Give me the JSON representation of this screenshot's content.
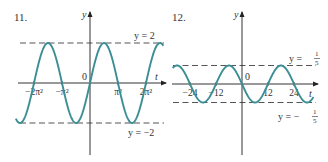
{
  "chart_data": [
    {
      "type": "line",
      "problem_number": "11.",
      "function_description": "sinusoid with amplitude 2 and period 2π²",
      "xlabel": "t",
      "ylabel": "y",
      "origin_label": "0",
      "x_ticks": [
        {
          "value_pi2": -2,
          "label": "−2π²"
        },
        {
          "value_pi2": -1,
          "label": "−π²"
        },
        {
          "value_pi2": 1,
          "label": "π²"
        },
        {
          "value_pi2": 2,
          "label": "2π²"
        }
      ],
      "x_unit": "π²",
      "xlim_pi2": [
        -2.65,
        2.62
      ],
      "amplitude": 2,
      "period_pi2": 2,
      "phase": "increasing through origin",
      "reference_lines": [
        {
          "y": 2,
          "label": "y = 2"
        },
        {
          "y": -2,
          "label": "y = −2"
        }
      ],
      "ylim": [
        -2.5,
        3.6
      ],
      "series": [
        {
          "name": "y = 2 sin(t/π)",
          "amplitude": 2,
          "period_pi2": 2,
          "sign": 1
        }
      ]
    },
    {
      "type": "line",
      "problem_number": "12.",
      "function_description": "sinusoid with amplitude 1/5 and period 24, decreasing through origin",
      "xlabel": "t",
      "ylabel": "y",
      "origin_label": "0",
      "x_ticks": [
        {
          "value": -24,
          "label": "−24"
        },
        {
          "value": -12,
          "label": "−12"
        },
        {
          "value": 12,
          "label": "12"
        },
        {
          "value": 24,
          "label": "24"
        }
      ],
      "xlim": [
        -32,
        33
      ],
      "amplitude": 0.2,
      "period": 24,
      "phase": "decreasing through origin",
      "reference_lines": [
        {
          "y": 0.2,
          "label_prefix": "y =",
          "label_num": "1",
          "label_den": "5"
        },
        {
          "y": -0.2,
          "label_prefix": "y = −",
          "label_num": "1",
          "label_den": "5"
        }
      ],
      "series": [
        {
          "name": "y = −(1/5) sin(πt/12)",
          "amplitude": 0.2,
          "period": 24,
          "sign": -1
        }
      ]
    }
  ]
}
